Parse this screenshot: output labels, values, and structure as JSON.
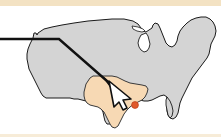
{
  "figure": {
    "width": 221,
    "height": 137,
    "background_color": "#ffffff",
    "top_band_color": "#f3e2c3",
    "bottom_band_color": "#f7ecd8"
  },
  "map": {
    "name": "united-states",
    "base_fill_color": "#d4d4d4",
    "base_stroke_color": "#1a1a1a",
    "base_stroke_width": 1.0,
    "highlight": {
      "state_name": "Texas",
      "fill_color": "#f7d9b4",
      "stroke_color": "#3a3a3a",
      "stroke_width": 1.0
    }
  },
  "annotation": {
    "pointer_line": {
      "name": "leader-line",
      "color": "#111111",
      "width": 2.4,
      "from_x": 0,
      "from_y": 39,
      "bend_x": 59,
      "bend_y": 39,
      "to_x": 115,
      "to_y": 88
    },
    "cursor": {
      "name": "mouse-cursor-arrow",
      "fill_color": "#ffffff",
      "stroke_color": "#111111",
      "tip_x": 108,
      "tip_y": 82,
      "label": "pointer"
    },
    "marker_dot": {
      "name": "location-marker-dot",
      "fill_color": "#e0592a",
      "stroke_color": "#c0441c",
      "x": 135,
      "y": 105,
      "radius": 3.4,
      "label": "marked city location"
    }
  }
}
